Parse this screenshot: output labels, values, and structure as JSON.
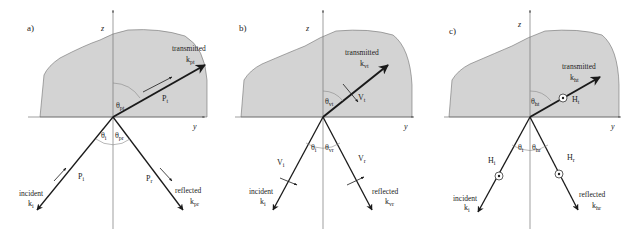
{
  "figure": {
    "colors": {
      "medium_fill": "#d3d3d3",
      "medium_stroke": "#6f6f6f",
      "axis": "#777777",
      "ray": "#1a1a1a",
      "text": "#222222"
    },
    "axes": {
      "z_label": "z",
      "y_label": "y"
    },
    "panels": [
      {
        "id": "a",
        "label": "a)",
        "transmitted": {
          "word": "transmitted",
          "k": "k",
          "k_sub": "pt"
        },
        "theta_t": {
          "sym": "θ",
          "sub": "pt"
        },
        "field_t": {
          "sym": "P",
          "sub": "t"
        },
        "incident": {
          "word": "incident",
          "k": "k",
          "k_sub": "i"
        },
        "field_i": {
          "sym": "P",
          "sub": "i"
        },
        "theta_i": {
          "sym": "θ",
          "sub": "i"
        },
        "theta_r": {
          "sym": "θ",
          "sub": "pr"
        },
        "reflected": {
          "word": "reflected",
          "k": "k",
          "k_sub": "pr"
        },
        "field_r": {
          "sym": "P",
          "sub": "r"
        }
      },
      {
        "id": "b",
        "label": "b)",
        "transmitted": {
          "word": "transmitted",
          "k": "k",
          "k_sub": "vt"
        },
        "theta_t": {
          "sym": "θ",
          "sub": "vt"
        },
        "field_t": {
          "sym": "V",
          "sub": "t"
        },
        "incident": {
          "word": "incident",
          "k": "k",
          "k_sub": "i"
        },
        "field_i": {
          "sym": "V",
          "sub": "i"
        },
        "theta_i": {
          "sym": "θ",
          "sub": "i"
        },
        "theta_r": {
          "sym": "θ",
          "sub": "vr"
        },
        "reflected": {
          "word": "reflected",
          "k": "k",
          "k_sub": "vr"
        },
        "field_r": {
          "sym": "V",
          "sub": "r"
        }
      },
      {
        "id": "c",
        "label": "c)",
        "transmitted": {
          "word": "transmitted",
          "k": "k",
          "k_sub": "ht"
        },
        "theta_t": {
          "sym": "θ",
          "sub": "ht"
        },
        "field_t": {
          "sym": "H",
          "sub": "t"
        },
        "incident": {
          "word": "incident",
          "k": "k",
          "k_sub": "i"
        },
        "field_i": {
          "sym": "H",
          "sub": "i"
        },
        "theta_i": {
          "sym": "θ",
          "sub": "i"
        },
        "theta_r": {
          "sym": "θ",
          "sub": "hr"
        },
        "reflected": {
          "word": "reflected",
          "k": "k",
          "k_sub": "hr"
        },
        "field_r": {
          "sym": "H",
          "sub": "r"
        }
      }
    ]
  }
}
